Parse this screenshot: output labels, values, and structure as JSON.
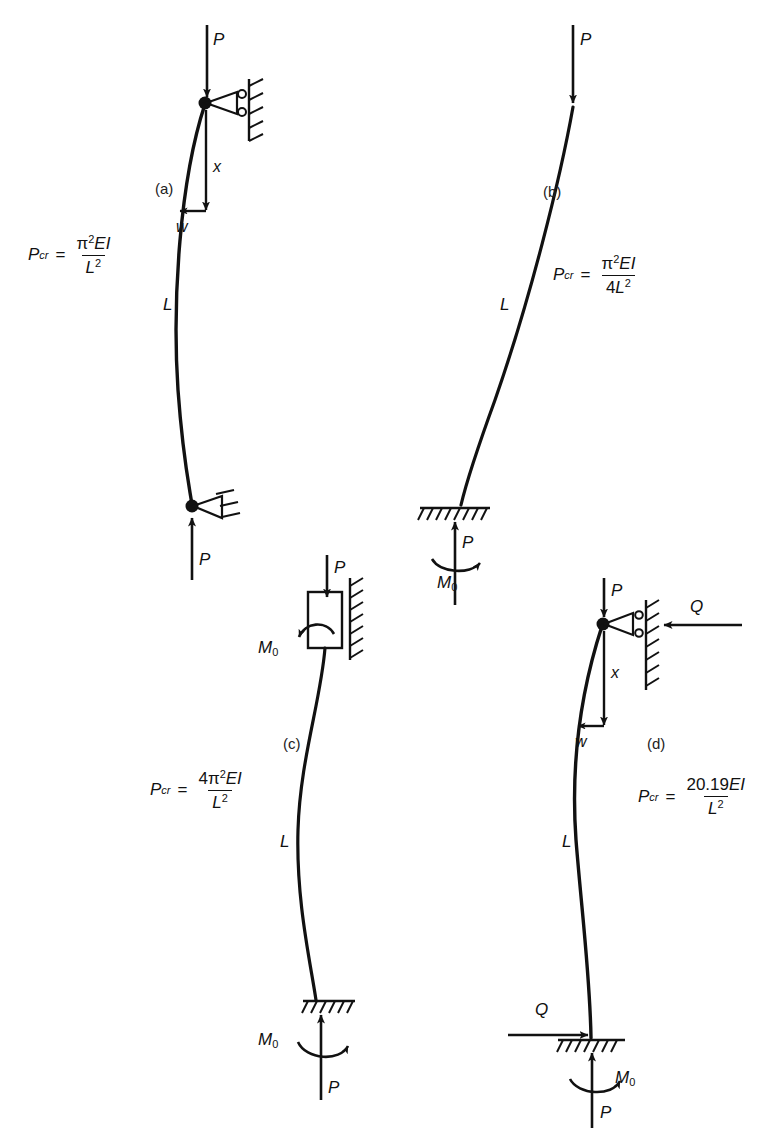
{
  "figure": {
    "type": "engineering-diagram",
    "stroke_color": "#111111",
    "background": "#ffffff"
  },
  "cases": [
    {
      "id": "a",
      "label": "(a)",
      "support_top": "roller-against-wall",
      "support_bottom": "pin",
      "formula": {
        "symbol": "P",
        "symbol_sub": "cr",
        "equals": "=",
        "numerator_prefix": "",
        "numerator_pi": "π",
        "numerator_pi_sup": "2",
        "numerator_tail": "EI",
        "denominator_prefix": "",
        "denominator_base": "L",
        "denominator_sup": "2",
        "plain": "P_cr = π²EI / L²"
      },
      "labels": {
        "load_top": "P",
        "load_bottom": "P",
        "length": "L",
        "coordinate_x": "x",
        "deflection_w": "w"
      }
    },
    {
      "id": "b",
      "label": "(b)",
      "support_top": "free",
      "support_bottom": "fixed",
      "formula": {
        "symbol": "P",
        "symbol_sub": "cr",
        "equals": "=",
        "numerator_prefix": "",
        "numerator_pi": "π",
        "numerator_pi_sup": "2",
        "numerator_tail": "EI",
        "denominator_prefix": "4",
        "denominator_base": "L",
        "denominator_sup": "2",
        "plain": "P_cr = π²EI / 4L²"
      },
      "labels": {
        "load_top": "P",
        "load_bottom": "P",
        "length": "L",
        "moment": "M",
        "moment_sub": "0"
      }
    },
    {
      "id": "c",
      "label": "(c)",
      "support_top": "sliding-block-against-wall",
      "support_bottom": "fixed",
      "formula": {
        "symbol": "P",
        "symbol_sub": "cr",
        "equals": "=",
        "numerator_prefix": "4",
        "numerator_pi": "π",
        "numerator_pi_sup": "2",
        "numerator_tail": "EI",
        "denominator_prefix": "",
        "denominator_base": "L",
        "denominator_sup": "2",
        "plain": "P_cr = 4π²EI / L²"
      },
      "labels": {
        "load_top": "P",
        "load_bottom": "P",
        "length": "L",
        "moment_top": "M",
        "moment_top_sub": "0",
        "moment_bottom": "M",
        "moment_bottom_sub": "0"
      }
    },
    {
      "id": "d",
      "label": "(d)",
      "support_top": "roller-against-wall",
      "support_bottom": "fixed",
      "formula": {
        "symbol": "P",
        "symbol_sub": "cr",
        "equals": "=",
        "numerator_coefficient": "20.19",
        "numerator_tail": "EI",
        "denominator_base": "L",
        "denominator_sup": "2",
        "plain": "P_cr = 20.19EI / L²"
      },
      "labels": {
        "load_top": "P",
        "load_bottom": "P",
        "length": "L",
        "coordinate_x": "x",
        "deflection_w": "w",
        "shear_top": "Q",
        "shear_bottom": "Q",
        "moment": "M",
        "moment_sub": "0"
      }
    }
  ]
}
